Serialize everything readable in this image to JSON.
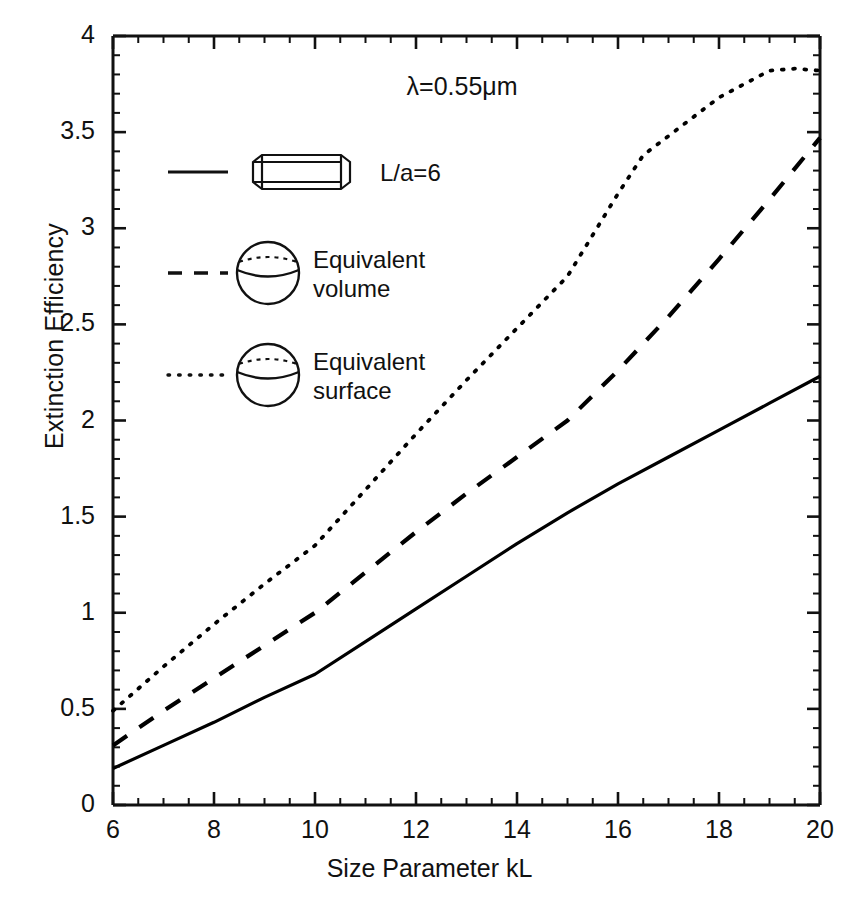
{
  "chart_data": {
    "type": "line",
    "title": "",
    "xlabel": "Size Parameter kL",
    "ylabel": "Extinction Efficiency",
    "xlim": [
      6,
      20
    ],
    "ylim": [
      0,
      4
    ],
    "xticks": [
      "6",
      "8",
      "10",
      "12",
      "14",
      "16",
      "18",
      "20"
    ],
    "xtick_values": [
      6,
      8,
      10,
      12,
      14,
      16,
      18,
      20
    ],
    "yticks": [
      "0",
      "0.5",
      "1",
      "1.5",
      "2",
      "2.5",
      "3",
      "3.5",
      "4"
    ],
    "ytick_values": [
      0,
      0.5,
      1,
      1.5,
      2,
      2.5,
      3,
      3.5,
      4
    ],
    "minor_ticks": true,
    "grid": false,
    "legend_position": "upper-left-inside",
    "annotations": [
      {
        "text": "λ=0.55μm",
        "x": 13.2,
        "y": 3.73
      }
    ],
    "series": [
      {
        "name": "L/a=6",
        "style": "solid",
        "icon": "cylinder",
        "color": "#000000",
        "x": [
          6,
          7,
          8,
          9,
          10,
          11,
          12,
          13,
          14,
          15,
          16,
          17,
          18,
          19,
          20
        ],
        "y": [
          0.19,
          0.31,
          0.43,
          0.56,
          0.68,
          0.85,
          1.02,
          1.19,
          1.36,
          1.52,
          1.67,
          1.81,
          1.95,
          2.09,
          2.23
        ]
      },
      {
        "name": "Equivalent volume",
        "style": "dashed",
        "icon": "sphere",
        "color": "#000000",
        "x": [
          6,
          7,
          8,
          9,
          10,
          11,
          12,
          13,
          14,
          15,
          16,
          17,
          18,
          19,
          20
        ],
        "y": [
          0.31,
          0.49,
          0.66,
          0.83,
          1.0,
          1.21,
          1.42,
          1.62,
          1.81,
          2.0,
          2.26,
          2.54,
          2.84,
          3.15,
          3.47
        ]
      },
      {
        "name": "Equivalent surface",
        "style": "dotted",
        "icon": "sphere",
        "color": "#000000",
        "x": [
          6,
          7,
          8,
          9,
          10,
          11,
          12,
          13,
          14,
          15,
          16,
          16.5,
          17,
          18,
          19,
          19.5,
          20
        ],
        "y": [
          0.49,
          0.72,
          0.94,
          1.15,
          1.35,
          1.64,
          1.93,
          2.21,
          2.48,
          2.75,
          3.18,
          3.38,
          3.48,
          3.68,
          3.82,
          3.83,
          3.82
        ]
      }
    ]
  },
  "legend": {
    "items": [
      {
        "label": "L/a=6",
        "style": "solid",
        "icon": "cylinder-icon"
      },
      {
        "label": "Equivalent\nvolume",
        "style": "dashed",
        "icon": "sphere-icon"
      },
      {
        "label": "Equivalent\nsurface",
        "style": "dotted",
        "icon": "sphere-icon"
      }
    ]
  }
}
